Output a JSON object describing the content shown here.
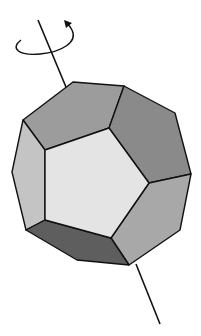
{
  "diagram": {
    "colors": {
      "background": "#ffffff",
      "front_face": "#e4e4e4",
      "top_face": "#9c9c9c",
      "upper_right_face": "#8a8a8a",
      "left_face": "#c4c4c4",
      "lower_right_face": "#a8a8a8",
      "bottom_face": "#5e5e5e",
      "stroke": "#111111"
    },
    "axis": {
      "top": [
        38,
        20
      ],
      "top_end_inside": [
        76,
        111
      ],
      "bottom_start": [
        136,
        264
      ],
      "bottom": [
        160,
        324
      ]
    }
  }
}
